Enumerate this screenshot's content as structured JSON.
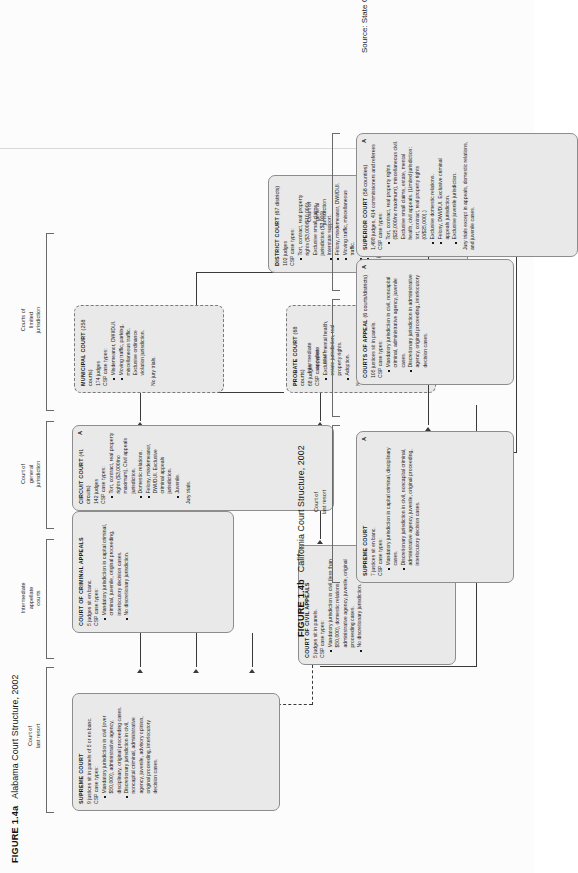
{
  "figures": {
    "alabama": {
      "number": "FIGURE 1.4a",
      "title": "Alabama Court Structure, 2002",
      "tiers": [
        {
          "id": "last-resort",
          "label": "Court of\nlast resort"
        },
        {
          "id": "intermediate",
          "label": "Intermediate\nappellate\ncourts"
        },
        {
          "id": "general",
          "label": "Court of\ngeneral\njurisdiction"
        },
        {
          "id": "limited",
          "label": "Courts of\nlimited\njurisdiction"
        }
      ],
      "courts": [
        {
          "id": "supreme-court",
          "name": "SUPREME COURT",
          "qualifier": "",
          "composition": "9 justices sit in panels of 5 or en banc.",
          "case_types_label": "CSP case types:",
          "bullets": [
            "Mandatory jurisdiction in civil (over $50,000), administrative agency, disciplinary, original proceeding cases.",
            "Discretionary jurisdiction in civil, noncapital criminal, administrative agency, juvenile, advisory opinion, original proceeding, interlocutory decision cases."
          ],
          "footer": "",
          "dashed": false,
          "mark": ""
        },
        {
          "id": "court-of-civil-appeals",
          "name": "COURT OF CIVIL APPEALS",
          "qualifier": "",
          "composition": "5 judges sit in panels.",
          "case_types_label": "CSP case types:",
          "bullets": [
            "Mandatory jurisdiction in civil (less than $50,000), domestic relations, administrative agency, juvenile, original proceeding cases.",
            "No discretionary jurisdiction."
          ],
          "footer": "",
          "dashed": false,
          "mark": ""
        },
        {
          "id": "court-of-criminal-appeals",
          "name": "COURT OF CRIMINAL APPEALS",
          "qualifier": "",
          "composition": "5 judges sit en banc.",
          "case_types_label": "CSP case types:",
          "bullets": [
            "Mandatory jurisdiction in capital criminal, criminal, juvenile, original proceeding, interlocutory decision cases.",
            "No discretionary jurisdiction."
          ],
          "footer": "",
          "dashed": false,
          "mark": ""
        },
        {
          "id": "circuit-court",
          "name": "CIRCUIT COURT",
          "qualifier": "(41 circuits)",
          "composition": "142 judges",
          "case_types_label": "CSP case types:",
          "bullets": [
            "Tort, contract, real property rights ($3,000/no maximum), Civil appeals jurisdiction.",
            "Domestic relations.",
            "Felony, misdemeanor, DWI/DUI. Exclusive criminal appeals jurisdiction.",
            "Juvenile."
          ],
          "footer": "Jury trials.",
          "dashed": false,
          "mark": "A"
        },
        {
          "id": "probate-court",
          "name": "PROBATE COURT",
          "qualifier": "(68 courts)",
          "composition": "68 judges",
          "case_types_label": "CSP case types:",
          "bullets": [
            "Exclusive mental health, estate jurisdiction, real property rights.",
            "Adoption."
          ],
          "footer": "No jury trials.",
          "dashed": true,
          "mark": ""
        },
        {
          "id": "municipal-court",
          "name": "MUNICIPAL COURT",
          "qualifier": "(258 courts)",
          "composition": "174 judges",
          "case_types_label": "CSP case types:",
          "bullets": [
            "Misdemeanor, DWI/DUI.",
            "Moving traffic, parking, miscellaneous traffic. Exclusive ordinance violation jurisdiction."
          ],
          "footer": "No jury trials.",
          "dashed": true,
          "mark": ""
        },
        {
          "id": "district-court",
          "name": "DISTRICT COURT",
          "qualifier": "(67 districts)",
          "composition": "102 judges",
          "case_types_label": "CSP case types:",
          "bullets": [
            "Tort, contract, real property rights ($3,000/$10,000). Exclusive small claims jurisdiction ($3,000).",
            "Interstate support.",
            "Felony, misdemeanor, DWI/DUI.",
            "Moving traffic, miscellaneous traffic.",
            "Juvenile.",
            "Preliminary hearings."
          ],
          "footer": "No jury trials.",
          "dashed": false,
          "mark": ""
        }
      ]
    },
    "california": {
      "number": "FIGURE 1.4b",
      "title": "California Court Structure, 2002",
      "tiers": [
        {
          "id": "last-resort",
          "label": "Court of\nlast resort"
        },
        {
          "id": "intermediate",
          "label": "Intermediate\nappellate\ncourt"
        },
        {
          "id": "general",
          "label": "Court of\ngeneral\njurisdiction"
        }
      ],
      "courts": [
        {
          "id": "supreme-court",
          "name": "SUPREME COURT",
          "qualifier": "",
          "composition": "7 justices sit en banc.",
          "case_types_label": "CSP case types:",
          "bullets": [
            "Mandatory jurisdiction in capital criminal, disciplinary cases.",
            "Discretionary jurisdiction in civil, noncapital criminal, administrative agency, juvenile, original proceeding, interlocutory decision cases."
          ],
          "footer": "",
          "dashed": false,
          "mark": "A"
        },
        {
          "id": "courts-of-appeal",
          "name": "COURTS OF APPEAL",
          "qualifier": "(6 courts/districts)",
          "composition": "105 justices sit in panels.",
          "case_types_label": "CSP case types:",
          "bullets": [
            "Mandatory jurisdiction in civil, noncapital criminal, administrative agency, juvenile cases.",
            "Discretionary jurisdiction in administrative agency, original proceeding, interlocutory decision cases."
          ],
          "footer": "",
          "dashed": false,
          "mark": "A"
        },
        {
          "id": "superior-court",
          "name": "SUPERIOR COURT",
          "qualifier": "(58 counties)",
          "composition": "1,498 judges, 414 commissioners and referees",
          "case_types_label": "CSP case types:",
          "bullets": [
            "Tort, contract, real property rights ($25,000/no maximum), miscellaneous civil. Exclusive small claims, estate, mental health, civil appeals. (Limited jurisdiction: tort, contract, real property rights (0/$25,000).)",
            "Exclusive domestic relations.",
            "Felony, DWI/DUI. Exclusive criminal appeals jurisdiction.",
            "Exclusive juvenile jurisdiction."
          ],
          "footer": "Jury trials except in appeals, domestic relations, and juvenile cases.",
          "dashed": false,
          "mark": "A"
        }
      ]
    }
  },
  "source": "Source: State Court Caseload Statistics, 2003, pp. 8, 12."
}
